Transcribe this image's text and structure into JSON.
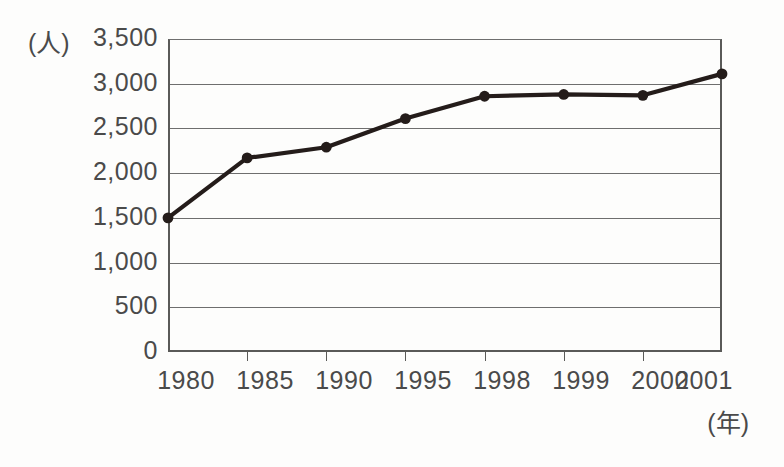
{
  "chart_data": {
    "type": "line",
    "title": "",
    "subtitle": "",
    "xlabel": "(年)",
    "ylabel": "(人)",
    "categories": [
      "1980",
      "1985",
      "1990",
      "1995",
      "1998",
      "1999",
      "2000",
      "2001"
    ],
    "values": [
      1500,
      2170,
      2290,
      2610,
      2860,
      2880,
      2870,
      3110
    ],
    "series": [
      {
        "name": "人数",
        "values": [
          1500,
          2170,
          2290,
          2610,
          2860,
          2880,
          2870,
          3110
        ]
      }
    ],
    "ylim": [
      0,
      3500
    ],
    "ytick_values": [
      3500,
      3000,
      2500,
      2000,
      1500,
      1000,
      500,
      0
    ],
    "ytick_labels": [
      "3,500",
      "3,000",
      "2,500",
      "2,000",
      "1,500",
      "1,000",
      "500",
      "0"
    ],
    "ytick_step": 500,
    "grid": true,
    "grid_axis": "y",
    "legend": false,
    "legend_position": "none",
    "marker": "filled-circle",
    "line_color": "#241c1a",
    "grid_color": "#6e6e6e",
    "axis_color": "#5a5a58",
    "text_color": "#4a4a4a",
    "background_color": "#fdfdfc"
  },
  "axes": {
    "y_unit_label": "(人)",
    "x_unit_label": "(年)"
  }
}
